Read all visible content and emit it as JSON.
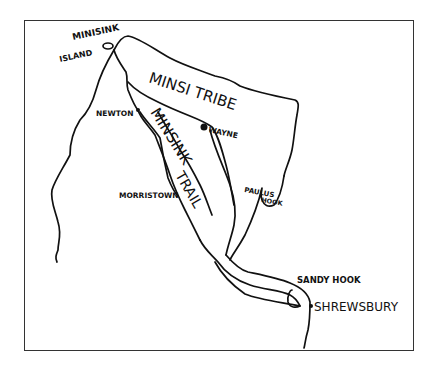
{
  "map": {
    "title_region": "Minsi Tribe",
    "trail_label": "Minisink Trail",
    "trail_label_words": [
      "MINSINK",
      "TRAIL"
    ],
    "colors": {
      "ink": "#111111",
      "background": "#ffffff",
      "frame": "#333333"
    },
    "places": [
      {
        "name": "MINISINK",
        "type": "label"
      },
      {
        "name": "ISLAND",
        "type": "label"
      },
      {
        "name": "NEWTON",
        "type": "town"
      },
      {
        "name": "WAYNE",
        "type": "town"
      },
      {
        "name": "MORRISTOWN",
        "type": "town"
      },
      {
        "name": "PAULUS HOOK",
        "type": "town"
      },
      {
        "name": "SANDY HOOK",
        "type": "town"
      },
      {
        "name": "SHREWSBURY",
        "type": "town"
      }
    ],
    "labels": {
      "region": "MINSI TRIBE",
      "minisink": "MINISINK",
      "island": "ISLAND",
      "newton": "NEWTON",
      "wayne": "WAYNE",
      "morristown": "MORRISTOWN",
      "paulus": "PAULUS",
      "hook": "HOOK",
      "sandy_hook": "SANDY HOOK",
      "shrewsbury": "SHREWSBURY",
      "trail_1": "MINSINK",
      "trail_2": "TRAIL"
    }
  }
}
